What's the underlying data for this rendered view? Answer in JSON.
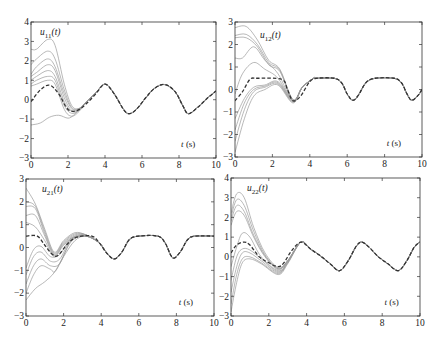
{
  "figure": {
    "layout": "2x2 grid of subplots",
    "xlabel_common": "t (s)"
  },
  "chart_data": [
    {
      "id": "u11",
      "type": "line",
      "title": "u11(t)",
      "label_main": "u",
      "label_sub": "11",
      "label_arg": "(t)",
      "xlabel": "t (s)",
      "ylabel": "",
      "xlim": [
        0,
        10
      ],
      "ylim": [
        -3,
        4
      ],
      "xticks": [
        0,
        2,
        4,
        6,
        8,
        10
      ],
      "yticks": [
        -3,
        -2,
        -1,
        0,
        1,
        2,
        3,
        4
      ],
      "grid": false,
      "frame": {
        "x0": 31,
        "y0": 22,
        "x1": 216,
        "y1": 158
      },
      "reference": {
        "name": "desired (dashed)",
        "x": [
          0,
          0.5,
          1.0,
          1.5,
          2.0,
          2.5,
          3.0,
          3.5,
          4.0,
          4.5,
          5.0,
          5.3,
          5.7,
          6.2,
          6.7,
          7.25,
          7.8,
          8.2,
          8.5,
          9.0,
          9.5,
          10.0
        ],
        "y": [
          -0.1,
          0.5,
          0.75,
          0.3,
          -0.5,
          -0.55,
          -0.2,
          0.3,
          0.8,
          0.3,
          -0.5,
          -0.72,
          -0.5,
          0.1,
          0.6,
          0.78,
          0.4,
          -0.3,
          -0.72,
          -0.4,
          0.05,
          0.45
        ]
      },
      "trials": [
        {
          "x": [
            0,
            0.3,
            0.9,
            1.3,
            1.8,
            2.2,
            2.6,
            3.0,
            3.5,
            4.0
          ],
          "y": [
            2.6,
            2.6,
            3.1,
            2.8,
            0.8,
            -0.3,
            -0.45,
            -0.1,
            0.35,
            0.8
          ]
        },
        {
          "x": [
            0,
            0.3,
            0.9,
            1.3,
            1.8,
            2.2,
            2.6,
            3.0,
            3.5,
            4.0
          ],
          "y": [
            1.8,
            2.1,
            2.5,
            2.1,
            0.5,
            -0.4,
            -0.45,
            -0.1,
            0.35,
            0.8
          ]
        },
        {
          "x": [
            0,
            0.3,
            0.9,
            1.3,
            1.8,
            2.2,
            2.6,
            3.0,
            3.5,
            4.0
          ],
          "y": [
            1.3,
            1.7,
            2.1,
            1.7,
            0.3,
            -0.45,
            -0.5,
            -0.1,
            0.35,
            0.8
          ]
        },
        {
          "x": [
            0,
            0.3,
            0.9,
            1.3,
            1.8,
            2.2,
            2.6,
            3.0,
            3.5,
            4.0
          ],
          "y": [
            1.2,
            1.4,
            1.8,
            1.5,
            0.1,
            -0.55,
            -0.5,
            -0.1,
            0.35,
            0.8
          ]
        },
        {
          "x": [
            0,
            0.3,
            0.9,
            1.3,
            1.8,
            2.2,
            2.6,
            3.0,
            3.5,
            4.0
          ],
          "y": [
            1.0,
            1.2,
            1.5,
            1.2,
            -0.1,
            -0.6,
            -0.55,
            -0.1,
            0.35,
            0.8
          ]
        },
        {
          "x": [
            0,
            0.3,
            0.9,
            1.3,
            1.8,
            2.2,
            2.6,
            3.0,
            3.5,
            4.0
          ],
          "y": [
            0.8,
            1.0,
            1.2,
            1.0,
            -0.3,
            -0.7,
            -0.55,
            -0.1,
            0.35,
            0.8
          ]
        },
        {
          "x": [
            0,
            0.3,
            0.9,
            1.3,
            1.8,
            2.2,
            2.6,
            3.0,
            3.5,
            4.0
          ],
          "y": [
            0.7,
            0.8,
            1.0,
            0.8,
            -0.5,
            -0.85,
            -0.6,
            -0.1,
            0.35,
            0.8
          ]
        },
        {
          "x": [
            0,
            0.5,
            1.0,
            1.5,
            2.0,
            2.3,
            2.6,
            3.0,
            3.5,
            4.0
          ],
          "y": [
            -1.3,
            -1.2,
            -0.9,
            -0.8,
            -0.95,
            -0.8,
            -0.5,
            -0.1,
            0.35,
            0.8
          ]
        }
      ]
    },
    {
      "id": "u12",
      "type": "line",
      "title": "u12(t)",
      "label_main": "u",
      "label_sub": "12",
      "label_arg": "(t)",
      "xlabel": "t (s)",
      "ylabel": "",
      "xlim": [
        0,
        10
      ],
      "ylim": [
        -3,
        3
      ],
      "xticks": [
        0,
        2,
        4,
        6,
        8,
        10
      ],
      "yticks": [
        -3,
        -2,
        -1,
        0,
        1,
        2,
        3
      ],
      "grid": false,
      "frame": {
        "x0": 235,
        "y0": 22,
        "x1": 422,
        "y1": 157
      },
      "reference": {
        "name": "desired (dashed)",
        "x": [
          0,
          0.4,
          0.8,
          1.2,
          2.5,
          2.8,
          3.1,
          3.5,
          4.0,
          4.4,
          5.3,
          5.7,
          6.0,
          6.3,
          6.6,
          7.0,
          7.5,
          8.5,
          8.9,
          9.2,
          9.45,
          9.8,
          10.0
        ],
        "y": [
          -0.5,
          -0.1,
          0.45,
          0.5,
          0.45,
          0.0,
          -0.5,
          -0.3,
          0.35,
          0.5,
          0.5,
          0.3,
          -0.2,
          -0.48,
          -0.25,
          0.3,
          0.5,
          0.5,
          0.3,
          -0.2,
          -0.48,
          -0.25,
          0.0
        ]
      },
      "trials": [
        {
          "x": [
            0,
            0.6,
            1.2,
            1.8,
            2.4,
            3.1,
            3.6,
            4.2
          ],
          "y": [
            2.75,
            2.8,
            2.2,
            1.3,
            0.9,
            -0.45,
            0.1,
            0.5
          ]
        },
        {
          "x": [
            0,
            0.6,
            1.2,
            1.8,
            2.4,
            3.1,
            3.6,
            4.2
          ],
          "y": [
            2.4,
            2.45,
            2.0,
            1.2,
            0.85,
            -0.45,
            0.1,
            0.5
          ]
        },
        {
          "x": [
            0,
            0.6,
            1.2,
            1.8,
            2.4,
            3.1,
            3.6,
            4.2
          ],
          "y": [
            2.3,
            2.3,
            1.9,
            1.1,
            0.8,
            -0.5,
            0.1,
            0.5
          ]
        },
        {
          "x": [
            0,
            0.4,
            1.0,
            1.6,
            2.3,
            3.1,
            3.6,
            4.2
          ],
          "y": [
            1.4,
            1.4,
            1.9,
            1.3,
            0.7,
            -0.5,
            0.1,
            0.5
          ]
        },
        {
          "x": [
            0,
            0.4,
            1.0,
            1.6,
            2.3,
            3.1,
            3.6,
            4.2
          ],
          "y": [
            -0.2,
            0.7,
            1.2,
            0.9,
            0.5,
            -0.5,
            0.1,
            0.5
          ]
        },
        {
          "x": [
            0,
            0.5,
            1.0,
            1.6,
            2.3,
            3.1,
            3.6,
            4.2
          ],
          "y": [
            -1.3,
            -0.4,
            0.1,
            0.2,
            0.35,
            -0.5,
            0.1,
            0.5
          ]
        },
        {
          "x": [
            0,
            0.5,
            1.0,
            1.6,
            2.3,
            3.1,
            3.6,
            4.2
          ],
          "y": [
            -1.8,
            -0.6,
            0.0,
            0.15,
            0.3,
            -0.55,
            0.1,
            0.5
          ]
        },
        {
          "x": [
            0,
            0.5,
            1.0,
            1.6,
            2.3,
            3.1,
            3.6,
            4.2
          ],
          "y": [
            -2.3,
            -0.9,
            -0.1,
            0.1,
            0.25,
            -0.55,
            0.1,
            0.5
          ]
        },
        {
          "x": [
            0,
            0.5,
            1.0,
            1.6,
            2.3,
            3.1,
            3.6,
            4.2
          ],
          "y": [
            -2.8,
            -1.3,
            -0.3,
            0.0,
            0.2,
            -0.6,
            0.1,
            0.5
          ]
        }
      ]
    },
    {
      "id": "u21",
      "type": "line",
      "title": "u21(t)",
      "label_main": "u",
      "label_sub": "21",
      "label_arg": "(t)",
      "xlabel": "t (s)",
      "ylabel": "",
      "xlim": [
        0,
        10
      ],
      "ylim": [
        -3,
        3
      ],
      "xticks": [
        0,
        2,
        4,
        6,
        8,
        10
      ],
      "yticks": [
        -3,
        -2,
        -1,
        0,
        1,
        2,
        3
      ],
      "grid": false,
      "frame": {
        "x0": 26,
        "y0": 179,
        "x1": 214,
        "y1": 316
      },
      "reference": {
        "name": "desired (dashed)",
        "x": [
          0,
          0.6,
          1.0,
          1.4,
          1.7,
          2.2,
          2.7,
          3.5,
          3.9,
          4.3,
          4.7,
          5.1,
          5.5,
          6.0,
          7.0,
          7.4,
          7.8,
          8.2,
          8.6,
          9.0,
          10.0
        ],
        "y": [
          0.5,
          0.5,
          0.1,
          -0.3,
          -0.35,
          0.15,
          0.45,
          0.5,
          0.2,
          -0.25,
          -0.5,
          -0.2,
          0.35,
          0.5,
          0.5,
          0.2,
          -0.45,
          -0.2,
          0.35,
          0.5,
          0.5
        ]
      },
      "trials": [
        {
          "x": [
            0,
            0.5,
            1.0,
            1.5,
            2.0,
            2.6,
            3.2,
            3.9
          ],
          "y": [
            2.6,
            1.9,
            0.8,
            -0.2,
            0.3,
            0.65,
            0.55,
            0.2
          ]
        },
        {
          "x": [
            0,
            0.5,
            1.0,
            1.5,
            2.0,
            2.6,
            3.2,
            3.9
          ],
          "y": [
            2.0,
            1.8,
            0.7,
            -0.25,
            0.25,
            0.6,
            0.55,
            0.2
          ]
        },
        {
          "x": [
            0,
            0.5,
            1.0,
            1.5,
            2.0,
            2.6,
            3.2,
            3.9
          ],
          "y": [
            1.8,
            1.7,
            0.6,
            -0.3,
            0.2,
            0.55,
            0.55,
            0.2
          ]
        },
        {
          "x": [
            0,
            0.5,
            1.0,
            1.5,
            2.0,
            2.6,
            3.2,
            3.9
          ],
          "y": [
            1.4,
            1.4,
            0.5,
            -0.35,
            0.15,
            0.5,
            0.55,
            0.2
          ]
        },
        {
          "x": [
            0,
            0.5,
            1.0,
            1.5,
            2.0,
            2.6,
            3.2,
            3.9
          ],
          "y": [
            1.1,
            0.9,
            0.3,
            -0.4,
            0.1,
            0.45,
            0.5,
            0.2
          ]
        },
        {
          "x": [
            0,
            0.4,
            0.8,
            1.3,
            1.8,
            2.4,
            3.2,
            3.9
          ],
          "y": [
            -0.9,
            -0.1,
            0.05,
            -0.4,
            -0.3,
            0.4,
            0.5,
            0.2
          ]
        },
        {
          "x": [
            0,
            0.4,
            0.8,
            1.3,
            1.8,
            2.4,
            3.2,
            3.9
          ],
          "y": [
            -1.2,
            -0.4,
            -0.2,
            -0.6,
            -0.5,
            0.35,
            0.5,
            0.2
          ]
        },
        {
          "x": [
            0,
            0.4,
            0.8,
            1.3,
            1.8,
            2.4,
            3.2,
            3.9
          ],
          "y": [
            -1.6,
            -0.8,
            -0.5,
            -0.8,
            -0.7,
            0.3,
            0.5,
            0.2
          ]
        },
        {
          "x": [
            0,
            0.4,
            0.8,
            1.3,
            1.6,
            2.4,
            3.2,
            3.9
          ],
          "y": [
            -2.0,
            -1.2,
            -0.8,
            -0.95,
            -1.0,
            0.25,
            0.5,
            0.2
          ]
        },
        {
          "x": [
            0,
            0.5,
            1.0,
            1.5,
            2.0,
            2.6,
            3.2,
            3.9
          ],
          "y": [
            -2.3,
            -1.8,
            -1.5,
            -1.1,
            -0.4,
            0.3,
            0.5,
            0.2
          ]
        }
      ]
    },
    {
      "id": "u22",
      "type": "line",
      "title": "u22(t)",
      "label_main": "u",
      "label_sub": "22",
      "label_arg": "(t)",
      "xlabel": "t (s)",
      "ylabel": "",
      "xlim": [
        0,
        10
      ],
      "ylim": [
        -3,
        4
      ],
      "xticks": [
        0,
        2,
        4,
        6,
        8,
        10
      ],
      "yticks": [
        -3,
        -2,
        -1,
        0,
        1,
        2,
        3,
        4
      ],
      "grid": false,
      "frame": {
        "x0": 231,
        "y0": 178,
        "x1": 420,
        "y1": 316
      },
      "reference": {
        "name": "desired (dashed)",
        "x": [
          0,
          0.3,
          0.7,
          1.0,
          1.5,
          2.0,
          2.5,
          2.8,
          3.2,
          3.7,
          4.2,
          4.8,
          5.3,
          5.75,
          6.2,
          6.6,
          6.9,
          7.3,
          7.8,
          8.3,
          8.85,
          9.3,
          9.7,
          10.0
        ],
        "y": [
          0.2,
          0.6,
          0.75,
          0.6,
          0.0,
          -0.3,
          -0.5,
          -0.3,
          0.3,
          0.75,
          0.4,
          0.0,
          -0.4,
          -0.7,
          -0.2,
          0.5,
          0.75,
          0.5,
          0.0,
          -0.35,
          -0.7,
          -0.2,
          0.5,
          0.75
        ]
      },
      "trials": [
        {
          "x": [
            0,
            0.3,
            0.7,
            1.2,
            1.8,
            2.5,
            3.0,
            3.7
          ],
          "y": [
            2.2,
            3.2,
            3.0,
            1.5,
            0.2,
            -0.55,
            -0.2,
            0.75
          ]
        },
        {
          "x": [
            0,
            0.3,
            0.7,
            1.2,
            1.8,
            2.5,
            3.0,
            3.7
          ],
          "y": [
            2.0,
            2.9,
            2.6,
            1.3,
            0.1,
            -0.6,
            -0.2,
            0.75
          ]
        },
        {
          "x": [
            0,
            0.3,
            0.7,
            1.2,
            1.8,
            2.5,
            3.0,
            3.7
          ],
          "y": [
            1.8,
            2.6,
            2.3,
            1.1,
            0.05,
            -0.6,
            -0.2,
            0.75
          ]
        },
        {
          "x": [
            0,
            0.3,
            0.7,
            1.2,
            1.8,
            2.5,
            3.0,
            3.7
          ],
          "y": [
            1.6,
            2.3,
            2.1,
            1.0,
            0.0,
            -0.65,
            -0.2,
            0.75
          ]
        },
        {
          "x": [
            0,
            0.3,
            0.6,
            1.0,
            1.6,
            2.5,
            3.0,
            3.7
          ],
          "y": [
            -0.5,
            0.5,
            1.2,
            1.0,
            0.0,
            -0.7,
            -0.25,
            0.75
          ]
        },
        {
          "x": [
            0,
            0.3,
            0.6,
            1.0,
            1.6,
            2.5,
            3.0,
            3.7
          ],
          "y": [
            -1.2,
            0.0,
            0.4,
            0.35,
            -0.1,
            -0.75,
            -0.25,
            0.75
          ]
        },
        {
          "x": [
            0,
            0.3,
            0.6,
            1.0,
            1.6,
            2.5,
            3.0,
            3.7
          ],
          "y": [
            -1.8,
            -0.5,
            0.2,
            0.2,
            -0.2,
            -0.8,
            -0.3,
            0.75
          ]
        },
        {
          "x": [
            0,
            0.3,
            0.6,
            1.0,
            1.6,
            2.5,
            3.0,
            3.7
          ],
          "y": [
            -2.4,
            -0.9,
            -0.1,
            0.0,
            -0.3,
            -0.85,
            -0.3,
            0.75
          ]
        },
        {
          "x": [
            0,
            0.3,
            0.6,
            1.0,
            1.6,
            2.5,
            3.0,
            3.7
          ],
          "y": [
            -2.8,
            -1.3,
            -0.3,
            -0.1,
            -0.35,
            -0.9,
            -0.35,
            0.75
          ]
        }
      ]
    }
  ]
}
